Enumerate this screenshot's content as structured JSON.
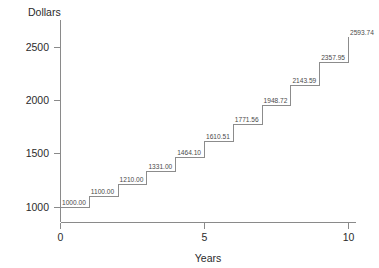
{
  "chart_data": {
    "type": "line",
    "subtype": "step",
    "title": "",
    "xlabel": "Years",
    "ylabel": "Dollars",
    "x": [
      0,
      1,
      2,
      3,
      4,
      5,
      6,
      7,
      8,
      9,
      10
    ],
    "values": [
      1000.0,
      1100.0,
      1210.0,
      1331.0,
      1464.1,
      1610.51,
      1771.56,
      1948.72,
      2143.59,
      2357.95,
      2593.74
    ],
    "point_labels": [
      "1000.00",
      "1100.00",
      "1210.00",
      "1331.00",
      "1464.10",
      "1610.51",
      "1771.56",
      "1948.72",
      "2143.59",
      "2357.95",
      "2593.74"
    ],
    "xticks": [
      0,
      5,
      10
    ],
    "xtick_labels": [
      "0",
      "5",
      "10"
    ],
    "yticks": [
      1000,
      1500,
      2000,
      2500
    ],
    "ytick_labels": [
      "1000",
      "1500",
      "2000",
      "2500"
    ],
    "xlim": [
      0,
      10
    ],
    "ylim": [
      950,
      2650
    ],
    "grid": false,
    "legend": false,
    "line_color": "#8c8c8c",
    "axis_color": "#8a8a8a",
    "text_color": "#2b2b2b",
    "label_color": "#4a4a4a",
    "background": "#ffffff"
  }
}
